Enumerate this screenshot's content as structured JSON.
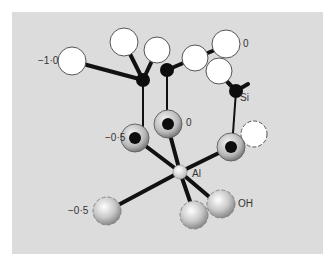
{
  "diagram": {
    "title": "",
    "background_color": "#dcdcdc",
    "labels": {
      "charge_top_left": "−1·0",
      "charge_top_right": "0",
      "si": "Si",
      "charge_mid_left": "−0·5",
      "charge_mid": "0",
      "al": "Al",
      "charge_bottom_left": "−0·5",
      "oh": "OH"
    },
    "atom_types": {
      "oxygen_surface": "white",
      "silicon": "black",
      "oxygen_bridging": "grey ring with black core",
      "aluminium": "small light sphere",
      "hydroxyl": "grey shaded sphere"
    }
  }
}
